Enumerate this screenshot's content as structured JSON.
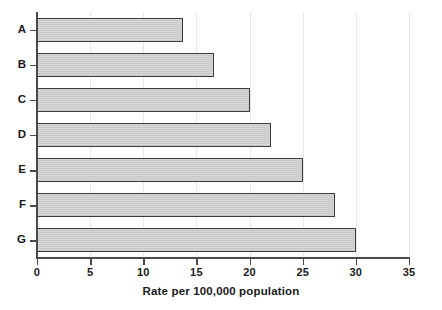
{
  "chart_data": {
    "type": "bar",
    "orientation": "horizontal",
    "title": "",
    "xlabel": "Rate per 100,000 population",
    "ylabel": "",
    "categories": [
      "A",
      "B",
      "C",
      "D",
      "E",
      "F",
      "G"
    ],
    "values": [
      13.7,
      16.7,
      20.0,
      22.0,
      25.0,
      28.0,
      30.0
    ],
    "xlim": [
      0,
      35
    ],
    "xticks": [
      0,
      5,
      10,
      15,
      20,
      25,
      30,
      35
    ],
    "xtick_labels": [
      "0",
      "5",
      "10",
      "15",
      "20",
      "25",
      "30",
      "35"
    ],
    "grid": true,
    "grid_axis": "x",
    "legend": null,
    "bar_fill_color": "#c9c9c9",
    "bar_border_color": "#3c3c3c",
    "axis_color": "#4a4a4a",
    "gridline_color": "#e8e8e8",
    "background_color": "#ffffff"
  }
}
